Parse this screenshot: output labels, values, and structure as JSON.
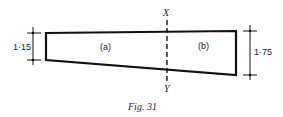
{
  "figure": {
    "caption": "Fig. 31",
    "section_axis": {
      "top_label": "X",
      "bottom_label": "Y"
    },
    "regions": [
      {
        "id": "a",
        "label": "(a)"
      },
      {
        "id": "b",
        "label": "(b)"
      }
    ],
    "dimensions": {
      "left_depth": "1·15",
      "right_depth": "1·75"
    },
    "colors": {
      "line": "#111111",
      "background": "#ffffff"
    }
  }
}
